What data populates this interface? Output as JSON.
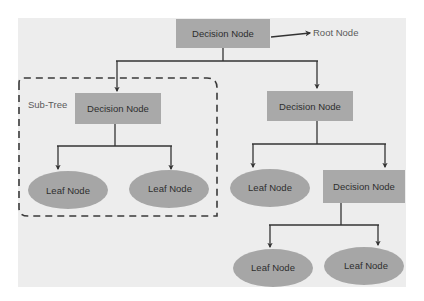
{
  "diagram": {
    "type": "decision-tree",
    "colors": {
      "background": "#ededed",
      "node_fill": "#a9a9a9",
      "leaf_fill": "#a6a6a6",
      "line": "#333333",
      "text": "#2e2e2e"
    },
    "annotations": {
      "root_label": "Root Node",
      "subtree_label": "Sub-Tree"
    },
    "nodes": {
      "root": {
        "label": "Decision Node",
        "kind": "decision"
      },
      "left_decision": {
        "label": "Decision Node",
        "kind": "decision"
      },
      "right_decision": {
        "label": "Decision Node",
        "kind": "decision"
      },
      "left_leaf_1": {
        "label": "Leaf Node",
        "kind": "leaf"
      },
      "left_leaf_2": {
        "label": "Leaf Node",
        "kind": "leaf"
      },
      "right_leaf_1": {
        "label": "Leaf Node",
        "kind": "leaf"
      },
      "right_decision_2": {
        "label": "Decision Node",
        "kind": "decision"
      },
      "bottom_leaf_1": {
        "label": "Leaf Node",
        "kind": "leaf"
      },
      "bottom_leaf_2": {
        "label": "Leaf Node",
        "kind": "leaf"
      }
    },
    "edges": [
      [
        "root",
        "left_decision"
      ],
      [
        "root",
        "right_decision"
      ],
      [
        "left_decision",
        "left_leaf_1"
      ],
      [
        "left_decision",
        "left_leaf_2"
      ],
      [
        "right_decision",
        "right_leaf_1"
      ],
      [
        "right_decision",
        "right_decision_2"
      ],
      [
        "right_decision_2",
        "bottom_leaf_1"
      ],
      [
        "right_decision_2",
        "bottom_leaf_2"
      ]
    ]
  }
}
